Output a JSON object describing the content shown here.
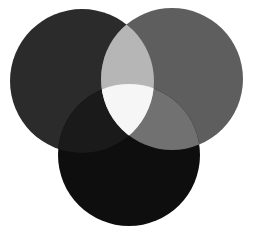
{
  "diagram": {
    "type": "venn",
    "set_count": 3,
    "background": "#ffffff",
    "circles": [
      {
        "id": "top-left",
        "cx": 82,
        "cy": 81,
        "r": 72,
        "fill": "#2b2b2b"
      },
      {
        "id": "top-right",
        "cx": 172,
        "cy": 79,
        "r": 71,
        "fill": "#5e5e5e"
      },
      {
        "id": "bottom",
        "cx": 129,
        "cy": 155,
        "r": 71,
        "fill": "#0e0e0e"
      }
    ],
    "regions": {
      "top_left_and_top_right": "#b6b6b6",
      "top_right_and_bottom": "#717171",
      "top_left_and_bottom": "#1a1a1a",
      "all_three": "#f6f6f6"
    }
  }
}
